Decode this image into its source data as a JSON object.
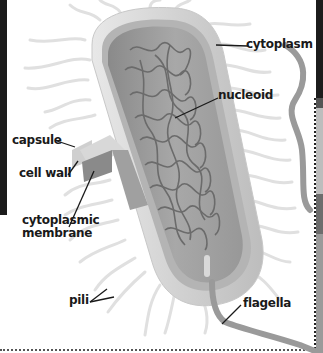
{
  "diagram": {
    "labels": {
      "cytoplasm": "cytoplasm",
      "nucleoid": "nucleoid",
      "capsule": "capsule",
      "cell_wall": "cell wall",
      "cytoplasmic_membrane_line1": "cytoplasmic",
      "cytoplasmic_membrane_line2": "membrane",
      "pili": "pili",
      "flagella": "flagella"
    },
    "colors": {
      "background": "#ffffff",
      "capsule": "#dcdcdc",
      "cell_wall": "#a9a9a9",
      "membrane": "#8f8f8f",
      "cytoplasm": "#9e9e9e",
      "nucleoid": "#6b6b6b",
      "pili": "#e2e2e2",
      "flagella": "#9a9a9a",
      "label_text": "#1a1a1a"
    }
  }
}
